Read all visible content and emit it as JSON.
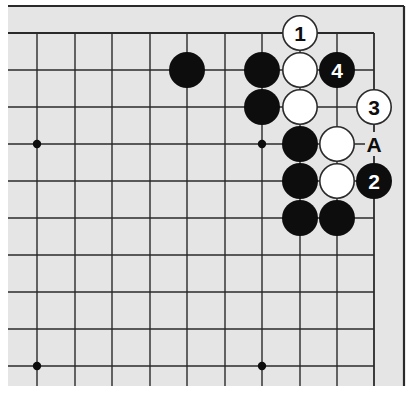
{
  "diagram": {
    "type": "go-board-corner",
    "corner": "top-right",
    "colors": {
      "paper": "#e5e5e5",
      "margin": "#ffffff",
      "line": "#2a2a2a",
      "black_stone": "#0d0d0d",
      "white_stone": "#ffffff",
      "stone_outline": "#2a2a2a"
    },
    "grid": {
      "columns_x": [
        37,
        75,
        112,
        150,
        187,
        225,
        262,
        300,
        337,
        374
      ],
      "rows_y": [
        33,
        70,
        107,
        144,
        181,
        218,
        255,
        292,
        329,
        366
      ],
      "left_extent": 8,
      "bottom_extent": 386,
      "edge_col": 9,
      "edge_row": 0
    },
    "frame": {
      "top_y": 6,
      "right_x": 404,
      "left_x": 8,
      "bottom_y": 386
    },
    "hoshi": [
      {
        "col": 0,
        "row": 3
      },
      {
        "col": 6,
        "row": 3
      },
      {
        "col": 0,
        "row": 9
      },
      {
        "col": 6,
        "row": 9
      }
    ],
    "stones": [
      {
        "color": "black",
        "col": 4,
        "row": 1,
        "label": ""
      },
      {
        "color": "black",
        "col": 6,
        "row": 1,
        "label": ""
      },
      {
        "color": "white",
        "col": 7,
        "row": 0,
        "label": "1"
      },
      {
        "color": "white",
        "col": 7,
        "row": 1,
        "label": ""
      },
      {
        "color": "black",
        "col": 8,
        "row": 1,
        "label": "4"
      },
      {
        "color": "black",
        "col": 6,
        "row": 2,
        "label": ""
      },
      {
        "color": "white",
        "col": 7,
        "row": 2,
        "label": ""
      },
      {
        "color": "white",
        "col": 9,
        "row": 2,
        "label": "3"
      },
      {
        "color": "black",
        "col": 7,
        "row": 3,
        "label": ""
      },
      {
        "color": "white",
        "col": 8,
        "row": 3,
        "label": ""
      },
      {
        "color": "black",
        "col": 7,
        "row": 4,
        "label": ""
      },
      {
        "color": "white",
        "col": 8,
        "row": 4,
        "label": ""
      },
      {
        "color": "black",
        "col": 9,
        "row": 4,
        "label": "2"
      },
      {
        "color": "black",
        "col": 7,
        "row": 5,
        "label": ""
      },
      {
        "color": "black",
        "col": 8,
        "row": 5,
        "label": ""
      }
    ],
    "point_labels": [
      {
        "col": 9,
        "row": 3,
        "text": "A"
      }
    ],
    "stone_radius": 18
  }
}
